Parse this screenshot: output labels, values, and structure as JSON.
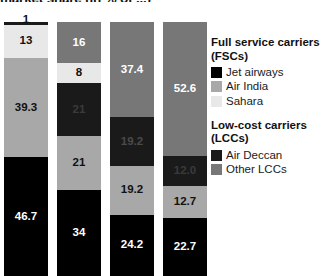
{
  "chart": {
    "title": "market share (in % of ...)",
    "title_note": "top of title clipped by image edge"
  },
  "chart_data": {
    "type": "bar",
    "stacked": true,
    "normalized_percent": true,
    "title": "market share (in % of ...)",
    "xlabel": "",
    "ylabel": "",
    "ylim": [
      0,
      100
    ],
    "grid": false,
    "legend_position": "right",
    "categories": [
      "Bar 1",
      "Bar 2",
      "Bar 3",
      "Bar 4"
    ],
    "series": [
      {
        "name": "Jet airways",
        "group": "Full service carriers (FSCs)",
        "color": "#000000",
        "values": [
          46.7,
          34,
          24.2,
          22.7
        ]
      },
      {
        "name": "Air India",
        "group": "Full service carriers (FSCs)",
        "color": "#a8a8a8",
        "values": [
          39.3,
          21,
          19.2,
          12.7
        ]
      },
      {
        "name": "Sahara",
        "group": "Full service carriers (FSCs)",
        "color": "#e8e8e8",
        "values": [
          13,
          8,
          0,
          0
        ]
      },
      {
        "name": "Air Deccan",
        "group": "Low-cost carriers (LCCs)",
        "color": "#1a1a1a",
        "values": [
          1,
          21,
          19.2,
          12.0
        ]
      },
      {
        "name": "Other LCCs",
        "group": "Low-cost carriers (LCCs)",
        "color": "#777777",
        "values": [
          0,
          16,
          37.4,
          52.6
        ]
      }
    ],
    "bars": [
      {
        "name": "Bar 1",
        "segments": [
          {
            "series": "Air Deccan",
            "value": 1,
            "label": "1",
            "color": "#1a1a1a",
            "label_color": "#111111",
            "label_outside_top": true
          },
          {
            "series": "Sahara",
            "value": 13,
            "label": "13",
            "color": "#e8e8e8",
            "label_color": "#111111"
          },
          {
            "series": "Air India",
            "value": 39.3,
            "label": "39.3",
            "color": "#a8a8a8",
            "label_color": "#111111"
          },
          {
            "series": "Jet airways",
            "value": 46.7,
            "label": "46.7",
            "color": "#000000",
            "label_color": "#ffffff"
          }
        ]
      },
      {
        "name": "Bar 2",
        "segments": [
          {
            "series": "Other LCCs",
            "value": 16,
            "label": "16",
            "color": "#777777",
            "label_color": "#ffffff"
          },
          {
            "series": "Sahara",
            "value": 8,
            "label": "8",
            "color": "#e8e8e8",
            "label_color": "#111111"
          },
          {
            "series": "Air Deccan",
            "value": 21,
            "label": "21",
            "color": "#1a1a1a",
            "label_color": "#3a3a3a"
          },
          {
            "series": "Air India",
            "value": 21,
            "label": "21",
            "color": "#a8a8a8",
            "label_color": "#111111"
          },
          {
            "series": "Jet airways",
            "value": 34,
            "label": "34",
            "color": "#000000",
            "label_color": "#ffffff"
          }
        ]
      },
      {
        "name": "Bar 3",
        "segments": [
          {
            "series": "Other LCCs",
            "value": 37.4,
            "label": "37.4",
            "color": "#777777",
            "label_color": "#ffffff"
          },
          {
            "series": "Air Deccan",
            "value": 19.2,
            "label": "19.2",
            "color": "#1a1a1a",
            "label_color": "#4a4a4a"
          },
          {
            "series": "Air India",
            "value": 19.2,
            "label": "19.2",
            "color": "#a8a8a8",
            "label_color": "#111111"
          },
          {
            "series": "Jet airways",
            "value": 24.2,
            "label": "24.2",
            "color": "#000000",
            "label_color": "#ffffff"
          }
        ]
      },
      {
        "name": "Bar 4",
        "segments": [
          {
            "series": "Other LCCs",
            "value": 52.6,
            "label": "52.6",
            "color": "#777777",
            "label_color": "#ffffff"
          },
          {
            "series": "Air Deccan",
            "value": 12.0,
            "label": "12.0",
            "color": "#1a1a1a",
            "label_color": "#3a3a3a"
          },
          {
            "series": "Air India",
            "value": 12.7,
            "label": "12.7",
            "color": "#a8a8a8",
            "label_color": "#111111"
          },
          {
            "series": "Jet airways",
            "value": 22.7,
            "label": "22.7",
            "color": "#000000",
            "label_color": "#ffffff"
          }
        ]
      }
    ]
  },
  "legend": {
    "groups": [
      {
        "heading": "Full service carriers (FSCs)",
        "items": [
          {
            "label": "Jet airways",
            "color": "#000000"
          },
          {
            "label": "Air India",
            "color": "#a8a8a8"
          },
          {
            "label": "Sahara",
            "color": "#e8e8e8"
          }
        ]
      },
      {
        "heading": "Low-cost carriers (LCCs)",
        "items": [
          {
            "label": "Air Deccan",
            "color": "#1a1a1a"
          },
          {
            "label": "Other LCCs",
            "color": "#777777"
          }
        ]
      }
    ]
  }
}
